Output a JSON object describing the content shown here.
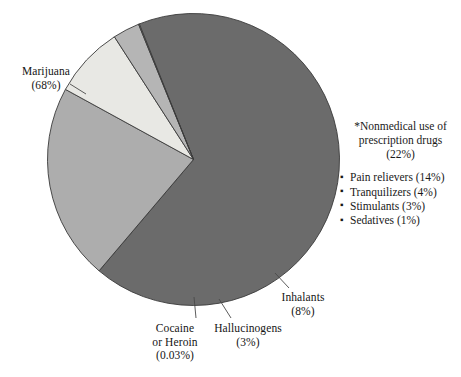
{
  "chart_data": {
    "type": "pie",
    "title": "",
    "subtitle": "",
    "xlabel": "",
    "ylabel": "",
    "legend_position": "none",
    "grid": false,
    "categories": [
      "Marijuana",
      "*Nonmedical use of prescription drugs",
      "Inhalants",
      "Hallucinogens",
      "Cocaine or Heroin"
    ],
    "values": [
      68,
      22,
      8,
      3,
      0.03
    ],
    "value_labels": [
      "68%",
      "22%",
      "8%",
      "3%",
      "0.03%"
    ],
    "slices": [
      {
        "name": "Marijuana",
        "value": 68,
        "value_label": "(68%)",
        "color": "#6b6b6b",
        "start_angle_deg": 112,
        "end_angle_deg": 356.8
      },
      {
        "name": "*Nonmedical use of prescription drugs",
        "value": 22,
        "value_label": "(22%)",
        "color": "#adadad",
        "start_angle_deg": 112,
        "end_angle_deg": 32.8
      },
      {
        "name": "Inhalants",
        "value": 8,
        "value_label": "(8%)",
        "color": "#e8e8e4",
        "start_angle_deg": 32.8,
        "end_angle_deg": 4.0
      },
      {
        "name": "Hallucinogens",
        "value": 3,
        "value_label": "(3%)",
        "color": "#b5b5b5",
        "start_angle_deg": 4.0,
        "end_angle_deg": 356.9
      },
      {
        "name": "Cocaine or Heroin",
        "value": 0.03,
        "value_label": "(0.03%)",
        "color": "#8a8a8a",
        "start_angle_deg": 356.9,
        "end_angle_deg": 356.8
      }
    ],
    "sub_breakdown": {
      "parent": "*Nonmedical use of prescription drugs",
      "parent_value_label": "(22%)",
      "items": [
        {
          "name": "Pain relievers",
          "value": 14,
          "value_label": "(14%)"
        },
        {
          "name": "Tranquilizers",
          "value": 4,
          "value_label": "(4%)"
        },
        {
          "name": "Stimulants",
          "value": 3,
          "value_label": "(3%)"
        },
        {
          "name": "Sedatives",
          "value": 1,
          "value_label": "(1%)"
        }
      ]
    }
  },
  "labels": {
    "marijuana": {
      "name": "Marijuana",
      "pct": "(68%)"
    },
    "inhalants": {
      "name": "Inhalants",
      "pct": "(8%)"
    },
    "hallucinogens": {
      "name": "Hallucinogens",
      "pct": "(3%)"
    },
    "cocaine": {
      "name_line1": "Cocaine",
      "name_line2": "or Heroin",
      "pct": "(0.03%)"
    }
  },
  "annotation": {
    "line1": "*Nonmedical use of",
    "line2": "prescription drugs",
    "line3": "(22%)",
    "bullet_glyph": "▪",
    "items": [
      "Pain relievers (14%)",
      "Tranquilizers (4%)",
      "Stimulants (3%)",
      "Sedatives (1%)"
    ]
  },
  "style": {
    "background": "#ffffff",
    "outline": "#3a3a3a",
    "text": "#151515",
    "leader_line": "#4a4a4a",
    "color_marijuana": "#6b6b6b",
    "color_prescription": "#adadad",
    "color_inhalants": "#e8e8e4",
    "color_hallucinogens": "#b5b5b5",
    "color_cocaine": "#8a8a8a"
  }
}
